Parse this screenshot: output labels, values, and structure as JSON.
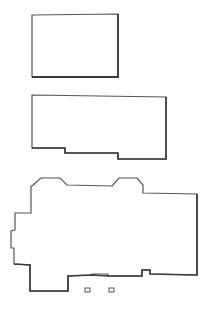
{
  "colors": {
    "background": "#ffffff",
    "stroke": "#555555",
    "stroke_heavy": "#3a3a3a"
  },
  "shapes": [
    {
      "name": "outline-upper-rectangle",
      "points": "32,15 118,14 118,77 32,77"
    },
    {
      "name": "outline-middle-stepped",
      "points": "32,95 166,97 166,159 118,159 118,153 65,153 65,148 32,148"
    },
    {
      "name": "outline-lower-complex",
      "points": "32,186 41,178 60,178 67,185 112,186 119,178 137,178 143,185 143,193 197,194 197,275 150,274 150,270 142,270 142,276 108,276 108,274 92,274 92,275 68,276 68,291 30,291 30,265 14,264 14,248 11,248 11,231 15,230 15,213 31,213 31,186"
    }
  ],
  "small_boxes": [
    {
      "name": "marker-left",
      "x": 85,
      "y": 288,
      "w": 5,
      "h": 4
    },
    {
      "name": "marker-right",
      "x": 109,
      "y": 288,
      "w": 5,
      "h": 4
    }
  ]
}
